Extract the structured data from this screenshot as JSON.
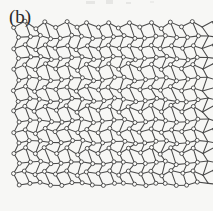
{
  "figure": {
    "panel_label": "(b)",
    "caption_text": "",
    "background_color": "#f7f7f5",
    "line_color": "#4a4a4a",
    "node_fill_color": "#fbfbf9",
    "node_stroke_color": "#3a3a3a"
  },
  "chart_data": {
    "type": "diagram",
    "title": "(b)",
    "subtitle": "",
    "xlabel": "",
    "ylabel": "",
    "lattice": {
      "name": "pentagonal (Cairo-type) tiling with triangles",
      "period_x": 42,
      "period_y": 42,
      "extent_x": [
        14,
        200
      ],
      "extent_y": [
        22,
        192
      ],
      "columns": 5,
      "rows": 4,
      "node_count": 109,
      "node_radius": 2.0,
      "tile_types": [
        "pentagon",
        "triangle"
      ]
    },
    "motif": {
      "comment": "One 42x42 unit cell expressed in fractional cell coordinates; replicated on a square grid to build the network.",
      "nodes": [
        [
          0.0,
          0.12
        ],
        [
          0.26,
          0.0
        ],
        [
          0.5,
          0.14
        ],
        [
          0.74,
          0.0
        ],
        [
          0.12,
          0.38
        ],
        [
          0.38,
          0.33
        ],
        [
          0.62,
          0.33
        ],
        [
          0.88,
          0.38
        ],
        [
          0.0,
          0.62
        ],
        [
          0.26,
          0.55
        ],
        [
          0.5,
          0.64
        ],
        [
          0.74,
          0.55
        ],
        [
          0.12,
          0.88
        ],
        [
          0.38,
          0.83
        ],
        [
          0.62,
          0.83
        ],
        [
          0.88,
          0.88
        ]
      ],
      "bonds": [
        [
          0,
          1
        ],
        [
          1,
          2
        ],
        [
          2,
          3
        ],
        [
          0,
          4
        ],
        [
          1,
          5
        ],
        [
          2,
          6
        ],
        [
          3,
          7
        ],
        [
          4,
          5
        ],
        [
          5,
          6
        ],
        [
          6,
          7
        ],
        [
          4,
          8
        ],
        [
          5,
          9
        ],
        [
          6,
          10
        ],
        [
          7,
          11
        ],
        [
          8,
          9
        ],
        [
          9,
          10
        ],
        [
          10,
          11
        ],
        [
          8,
          12
        ],
        [
          9,
          13
        ],
        [
          10,
          14
        ],
        [
          11,
          15
        ],
        [
          12,
          13
        ],
        [
          13,
          14
        ],
        [
          14,
          15
        ]
      ]
    },
    "grid": false,
    "legend": []
  }
}
